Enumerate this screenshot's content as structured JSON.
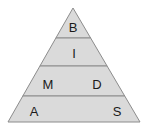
{
  "diagram": {
    "type": "pyramid",
    "title": "",
    "background_color": "#ffffff",
    "fill_color": "#dadada",
    "stroke_color": "#8c8c8c",
    "text_color": "#1a1a1a",
    "apex": {
      "x": 73,
      "y": 8
    },
    "base": {
      "left_x": 8,
      "right_x": 140,
      "y": 122
    },
    "divider_y": [
      38,
      66,
      96
    ],
    "tiers": [
      {
        "index": 0,
        "name": "tier-top",
        "labels": [
          {
            "text": "B",
            "x": 73,
            "y": 29
          }
        ]
      },
      {
        "index": 1,
        "name": "tier-second",
        "labels": [
          {
            "text": "I",
            "x": 74,
            "y": 55
          }
        ]
      },
      {
        "index": 2,
        "name": "tier-third",
        "labels": [
          {
            "text": "M",
            "x": 48,
            "y": 86
          },
          {
            "text": "D",
            "x": 97,
            "y": 86
          }
        ]
      },
      {
        "index": 3,
        "name": "tier-bottom",
        "labels": [
          {
            "text": "A",
            "x": 34,
            "y": 113
          },
          {
            "text": "S",
            "x": 117,
            "y": 113
          }
        ]
      }
    ]
  }
}
